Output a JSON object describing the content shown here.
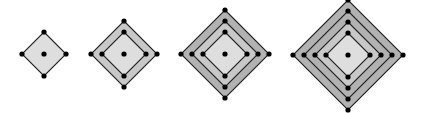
{
  "diagram": {
    "colors": {
      "background": "#ffffff",
      "inner_fill": "#dedede",
      "ring_fill_light": "#c8c8c8",
      "ring_fill_dark": "#b2b2b2",
      "stroke": "#222222",
      "dot": "#000000"
    },
    "step": 11,
    "dot_radius": 2.6,
    "figures": [
      {
        "id": "level-1",
        "cx": 44,
        "cy": 54,
        "layers": 1,
        "inner_half": 22
      },
      {
        "id": "level-2",
        "cx": 124,
        "cy": 54,
        "layers": 2,
        "inner_half": 22
      },
      {
        "id": "level-3",
        "cx": 225,
        "cy": 54,
        "layers": 3,
        "inner_half": 22
      },
      {
        "id": "level-4",
        "cx": 348,
        "cy": 55,
        "layers": 4,
        "inner_half": 22
      }
    ]
  }
}
